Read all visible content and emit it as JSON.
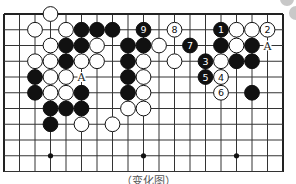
{
  "diagram": {
    "type": "go-board-fragment",
    "grid": {
      "cols": 19,
      "rows_visible": 11,
      "origin_x": 4,
      "origin_y": 14,
      "step_x": 15.5,
      "step_y": 15.75
    },
    "edges": {
      "top": true,
      "left": true,
      "right": true,
      "bottom": false
    },
    "star_points": [
      [
        3,
        9
      ],
      [
        9,
        9
      ],
      [
        15,
        9
      ]
    ],
    "colors": {
      "black": "#111111",
      "white": "#ffffff",
      "line": "#333333",
      "edge": "#222222",
      "decor": "#c8c8c8"
    },
    "stones": [
      {
        "c": 3,
        "r": 0,
        "color": "white"
      },
      {
        "c": 2,
        "r": 1,
        "color": "white"
      },
      {
        "c": 4,
        "r": 1,
        "color": "white"
      },
      {
        "c": 5,
        "r": 1,
        "color": "black"
      },
      {
        "c": 6,
        "r": 1,
        "color": "black"
      },
      {
        "c": 7,
        "r": 1,
        "color": "black"
      },
      {
        "c": 9,
        "r": 1,
        "color": "black",
        "label": "9"
      },
      {
        "c": 11,
        "r": 1,
        "color": "white",
        "label": "8"
      },
      {
        "c": 14,
        "r": 1,
        "color": "black",
        "label": "1"
      },
      {
        "c": 15,
        "r": 1,
        "color": "white"
      },
      {
        "c": 16,
        "r": 1,
        "color": "white"
      },
      {
        "c": 17,
        "r": 1,
        "color": "white",
        "label": "2"
      },
      {
        "c": 3,
        "r": 2,
        "color": "white"
      },
      {
        "c": 4,
        "r": 2,
        "color": "black"
      },
      {
        "c": 5,
        "r": 2,
        "color": "black"
      },
      {
        "c": 6,
        "r": 2,
        "color": "white"
      },
      {
        "c": 8,
        "r": 2,
        "color": "black"
      },
      {
        "c": 9,
        "r": 2,
        "color": "black"
      },
      {
        "c": 10,
        "r": 2,
        "color": "white"
      },
      {
        "c": 12,
        "r": 2,
        "color": "black",
        "label": "7"
      },
      {
        "c": 14,
        "r": 2,
        "color": "black"
      },
      {
        "c": 15,
        "r": 2,
        "color": "white"
      },
      {
        "c": 16,
        "r": 2,
        "color": "black"
      },
      {
        "c": 2,
        "r": 3,
        "color": "white"
      },
      {
        "c": 3,
        "r": 3,
        "color": "white"
      },
      {
        "c": 4,
        "r": 3,
        "color": "black"
      },
      {
        "c": 5,
        "r": 3,
        "color": "white"
      },
      {
        "c": 6,
        "r": 3,
        "color": "white"
      },
      {
        "c": 8,
        "r": 3,
        "color": "black"
      },
      {
        "c": 9,
        "r": 3,
        "color": "white"
      },
      {
        "c": 11,
        "r": 3,
        "color": "white"
      },
      {
        "c": 13,
        "r": 3,
        "color": "black",
        "label": "3"
      },
      {
        "c": 14,
        "r": 3,
        "color": "white"
      },
      {
        "c": 15,
        "r": 3,
        "color": "black"
      },
      {
        "c": 16,
        "r": 3,
        "color": "black"
      },
      {
        "c": 2,
        "r": 4,
        "color": "black"
      },
      {
        "c": 3,
        "r": 4,
        "color": "white"
      },
      {
        "c": 4,
        "r": 4,
        "color": "white"
      },
      {
        "c": 8,
        "r": 4,
        "color": "black"
      },
      {
        "c": 9,
        "r": 4,
        "color": "white"
      },
      {
        "c": 13,
        "r": 4,
        "color": "black",
        "label": "5"
      },
      {
        "c": 14,
        "r": 4,
        "color": "white",
        "label": "4"
      },
      {
        "c": 2,
        "r": 5,
        "color": "black"
      },
      {
        "c": 3,
        "r": 5,
        "color": "white"
      },
      {
        "c": 4,
        "r": 5,
        "color": "white"
      },
      {
        "c": 5,
        "r": 5,
        "color": "black"
      },
      {
        "c": 8,
        "r": 5,
        "color": "black"
      },
      {
        "c": 9,
        "r": 5,
        "color": "white"
      },
      {
        "c": 14,
        "r": 5,
        "color": "white",
        "label": "6"
      },
      {
        "c": 16,
        "r": 5,
        "color": "black"
      },
      {
        "c": 3,
        "r": 6,
        "color": "black"
      },
      {
        "c": 4,
        "r": 6,
        "color": "black"
      },
      {
        "c": 5,
        "r": 6,
        "color": "black"
      },
      {
        "c": 8,
        "r": 6,
        "color": "white"
      },
      {
        "c": 9,
        "r": 6,
        "color": "white"
      },
      {
        "c": 3,
        "r": 7,
        "color": "black"
      },
      {
        "c": 5,
        "r": 7,
        "color": "white"
      },
      {
        "c": 7,
        "r": 7,
        "color": "white"
      }
    ],
    "markers": [
      {
        "c": 5,
        "r": 4,
        "label": "A"
      },
      {
        "c": 17,
        "r": 2,
        "label": "A"
      }
    ],
    "caption": "（变化图）"
  }
}
